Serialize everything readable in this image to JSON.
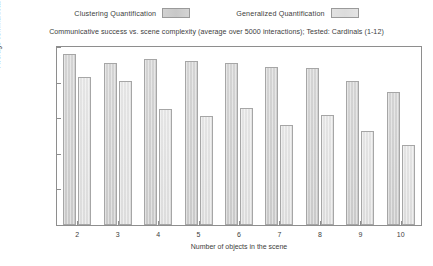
{
  "chart_data": {
    "type": "bar",
    "title": "Communicative success vs. scene complexity (average over 5000 interactions); Tested: Cardinals (1-12)",
    "xlabel": "Number of objects in the scene",
    "ylabel": "Average communicative success",
    "categories": [
      "2",
      "3",
      "4",
      "5",
      "6",
      "7",
      "8",
      "9",
      "10"
    ],
    "series": [
      {
        "name": "Clustering Quantification",
        "color": "#cdcdcd",
        "values": [
          0.96,
          0.91,
          0.93,
          0.92,
          0.91,
          0.89,
          0.88,
          0.81,
          0.75
        ]
      },
      {
        "name": "Generalized Quantification",
        "color": "#e0e0e0",
        "values": [
          0.83,
          0.81,
          0.65,
          0.61,
          0.66,
          0.56,
          0.62,
          0.53,
          0.45
        ]
      }
    ],
    "ylim": [
      0,
      1
    ],
    "yticks": [
      "0",
      "0.2",
      "0.4",
      "0.6",
      "0.8",
      "1"
    ],
    "ytick_values": [
      0,
      0.2,
      0.4,
      0.6,
      0.8,
      1
    ],
    "grid": false,
    "legend_position": "top"
  }
}
